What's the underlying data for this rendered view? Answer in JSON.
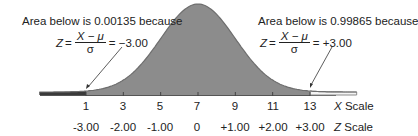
{
  "chart_data": {
    "type": "area",
    "title": "",
    "mean": 7,
    "std_dev": 2,
    "x_scale": {
      "label": "X Scale",
      "ticks": [
        "1",
        "3",
        "5",
        "7",
        "9",
        "11",
        "13"
      ],
      "values": [
        1,
        3,
        5,
        7,
        9,
        11,
        13
      ]
    },
    "z_scale": {
      "label": "Z Scale",
      "ticks": [
        "-3.00",
        "-2.00",
        "-1.00",
        "0",
        "+1.00",
        "+2.00",
        "+3.00"
      ],
      "values": [
        -3,
        -2,
        -1,
        0,
        1,
        2,
        3
      ]
    },
    "annotations": [
      {
        "text": "Area below is 0.00135 because",
        "formula_lhs": "Z",
        "numerator": "X − μ",
        "denominator": "σ",
        "result": "= −3.00",
        "points_to_x": 1
      },
      {
        "text": "Area below is 0.99865 because",
        "formula_lhs": "Z",
        "numerator": "X − μ",
        "denominator": "σ",
        "result": "= +3.00",
        "points_to_x": 13
      }
    ],
    "shaded_region": {
      "from": -1.5,
      "to": 13,
      "color": "#8a8a8a"
    },
    "left_tail_color": "#3a3a3a",
    "right_tail_color": "#ffffff",
    "grid": false,
    "legend": null
  }
}
